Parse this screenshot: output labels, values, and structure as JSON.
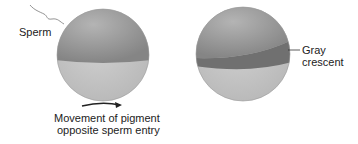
{
  "labels": {
    "sperm": "Sperm",
    "movement_line1": "Movement of pigment",
    "movement_line2": "opposite sperm entry",
    "gray_line1": "Gray",
    "gray_line2": "crescent"
  },
  "colors": {
    "top_hemisphere": "#8f8f8f",
    "bottom_hemisphere": "#c4c4c4",
    "crescent": "#6f6f6f",
    "text": "#222222"
  }
}
